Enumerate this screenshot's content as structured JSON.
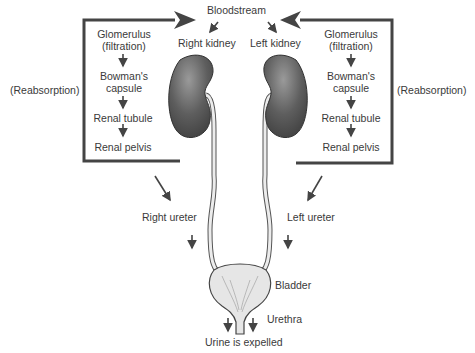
{
  "diagram": {
    "top_label": "Bloodstream",
    "kidneys": {
      "right": {
        "label": "Right kidney"
      },
      "left": {
        "label": "Left kidney"
      }
    },
    "process_steps_right": [
      "Glomerulus",
      "(filtration)",
      "Bowman's",
      "capsule",
      "Renal tubule",
      "Renal pelvis"
    ],
    "process_steps_left": [
      "Glomerulus",
      "(filtration)",
      "Bowman's",
      "capsule",
      "Renal tubule",
      "Renal pelvis"
    ],
    "reabsorption_left": "(Reabsorption)",
    "reabsorption_right": "(Reabsorption)",
    "right_ureter": "Right ureter",
    "left_ureter": "Left ureter",
    "bladder": "Bladder",
    "urethra": "Urethra",
    "outcome": "Urine is expelled",
    "colors": {
      "kidney": "#5a5a5a",
      "kidney_light": "#8a8a8a",
      "line": "#444444",
      "ureter_fill": "#e8e8e8",
      "bladder_fill": "#e4e4e4"
    }
  }
}
